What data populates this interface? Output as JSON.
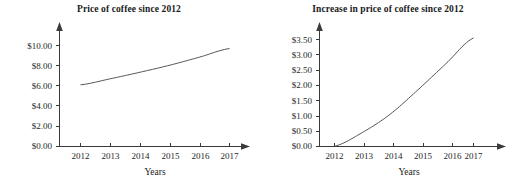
{
  "chart_data": [
    {
      "type": "line",
      "title": "Price of coffee since 2012",
      "xlabel": "Years",
      "ylabel": "",
      "x": [
        2012,
        2013,
        2014,
        2015,
        2016,
        2017
      ],
      "categories": [
        "2012",
        "2013",
        "2014",
        "2015",
        "2016",
        "2017"
      ],
      "values": [
        6.1,
        6.7,
        7.35,
        8.05,
        8.85,
        9.7
      ],
      "ytick_labels": [
        "$0.00",
        "$2.00",
        "$4.00",
        "$6.00",
        "$8.00",
        "$10.00"
      ],
      "ytick_values": [
        0,
        2,
        4,
        6,
        8,
        10
      ],
      "ylim": [
        0,
        10
      ],
      "xlim": [
        2012,
        2017
      ],
      "grid": false,
      "legend": "none",
      "line_color": "#555555"
    },
    {
      "type": "line",
      "title": "Increase in price of coffee since 2012",
      "xlabel": "Years",
      "ylabel": "",
      "x": [
        2012,
        2013,
        2014,
        2015,
        2016,
        2017
      ],
      "categories": [
        "2012",
        "2013",
        "2014",
        "2015",
        "2016",
        "2017"
      ],
      "values": [
        0.0,
        0.45,
        1.05,
        1.85,
        2.7,
        3.55
      ],
      "ytick_labels": [
        "$0.00",
        "$0.50",
        "$1.00",
        "$1.50",
        "$2.00",
        "$2.50",
        "$3.00",
        "$3.50"
      ],
      "ytick_values": [
        0,
        0.5,
        1.0,
        1.5,
        2.0,
        2.5,
        3.0,
        3.5
      ],
      "ylim": [
        0,
        3.5
      ],
      "xlim": [
        2012,
        2017
      ],
      "grid": false,
      "legend": "none",
      "line_color": "#555555"
    }
  ],
  "left_chart": {
    "title": "Price of coffee since 2012",
    "xlabel": "Years",
    "ytick_labels": [
      "$10.00",
      "$8.00",
      "$6.00",
      "$4.00",
      "$2.00",
      "$0.00"
    ],
    "xtick_labels": [
      "2012",
      "2013",
      "2014",
      "2015",
      "2016",
      "2017"
    ]
  },
  "right_chart": {
    "title": "Increase in price of coffee since 2012",
    "xlabel": "Years",
    "ytick_labels": [
      "$3.50",
      "$3.00",
      "$2.50",
      "$2.00",
      "$1.50",
      "$1.00",
      "$0.50",
      "$0.00"
    ],
    "xtick_labels": [
      "2012",
      "2013",
      "2014",
      "2015",
      "2016",
      "2017"
    ]
  }
}
